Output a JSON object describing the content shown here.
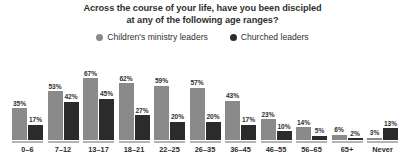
{
  "title": {
    "line1": "Across the course of your life, have you been discipled",
    "line2": "at any of the following age ranges?"
  },
  "legend": {
    "items": [
      {
        "label": "Children's ministry leaders",
        "color": "#8a8a8a",
        "marker": "circle-marker"
      },
      {
        "label": "Churched leaders",
        "color": "#2b2b2b",
        "marker": "circle-marker"
      }
    ]
  },
  "chart_data": {
    "type": "bar",
    "title": "Across the course of your life, have you been discipled at any of the following age ranges?",
    "xlabel": "",
    "ylabel": "",
    "ylim": [
      0,
      70
    ],
    "grid": false,
    "legend_position": "top-center",
    "value_suffix": "%",
    "categories": [
      "0–6",
      "7–12",
      "13–17",
      "18–21",
      "22–25",
      "26–35",
      "36–45",
      "46–55",
      "56–65",
      "65+",
      "Never"
    ],
    "series": [
      {
        "name": "Children's ministry leaders",
        "color": "#8a8a8a",
        "values": [
          35,
          53,
          67,
          62,
          59,
          57,
          43,
          23,
          14,
          6,
          3
        ],
        "labels": [
          "35%",
          "53%",
          "67%",
          "62%",
          "59%",
          "57%",
          "43%",
          "23%",
          "14%",
          "6%",
          "3%"
        ]
      },
      {
        "name": "Churched leaders",
        "color": "#2b2b2b",
        "values": [
          17,
          42,
          45,
          27,
          20,
          20,
          17,
          10,
          5,
          2,
          13
        ],
        "labels": [
          "17%",
          "42%",
          "45%",
          "27%",
          "20%",
          "20%",
          "17%",
          "10%",
          "5%",
          "2%",
          "13%"
        ]
      }
    ]
  }
}
